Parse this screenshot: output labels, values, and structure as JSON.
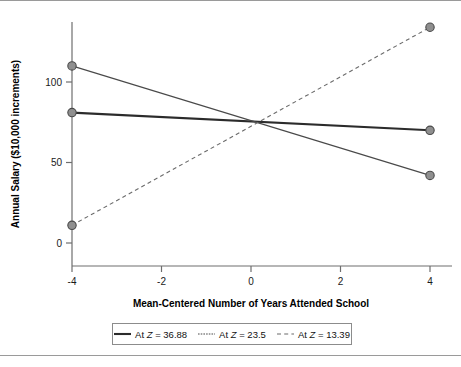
{
  "figure": {
    "has_top_rule": true,
    "has_bottom_rule": true
  },
  "axes": {
    "x": {
      "label": "Mean-Centered Number of Years Attended School",
      "ticks": [
        "-4",
        "-2",
        "0",
        "2",
        "4"
      ],
      "tick_values": [
        -4,
        -2,
        0,
        2,
        4
      ],
      "range": [
        -4.8,
        4.8
      ]
    },
    "y": {
      "label": "Annual Salary ($10,000 increments)",
      "ticks": [
        "0",
        "50",
        "100"
      ],
      "tick_values": [
        0,
        50,
        100
      ],
      "range": [
        -8,
        145
      ]
    }
  },
  "legend": {
    "entries": [
      {
        "label_prefix": "At ",
        "label_var": "Z",
        "label_suffix": " = 36.88",
        "style": "solid-thick"
      },
      {
        "label_prefix": "At ",
        "label_var": "Z",
        "label_suffix": " = 23.5",
        "style": "solid-thin"
      },
      {
        "label_prefix": "At ",
        "label_var": "Z",
        "label_suffix": " = 13.39",
        "style": "dashed"
      }
    ]
  },
  "chart_data": {
    "type": "line",
    "title": "",
    "subtitle": "",
    "xlabel": "Mean-Centered Number of Years Attended School",
    "ylabel": "Annual Salary ($10,000 increments)",
    "x": [
      -4,
      4
    ],
    "xlim": [
      -4.8,
      4.8
    ],
    "ylim": [
      -8,
      145
    ],
    "xticks": [
      -4,
      -2,
      0,
      2,
      4
    ],
    "yticks": [
      0,
      50,
      100
    ],
    "grid": false,
    "legend_position": "bottom-center",
    "markers": "filled-gray-circles-at-endpoints",
    "series": [
      {
        "name": "At Z = 36.88",
        "z_value": 36.88,
        "style": "solid-thick",
        "values": [
          81,
          70
        ],
        "points": [
          {
            "x": -4,
            "y": 81
          },
          {
            "x": 4,
            "y": 70
          }
        ]
      },
      {
        "name": "At Z = 23.5",
        "z_value": 23.5,
        "style": "solid-thin",
        "values": [
          110,
          42
        ],
        "points": [
          {
            "x": -4,
            "y": 110
          },
          {
            "x": 4,
            "y": 42
          }
        ]
      },
      {
        "name": "At Z = 13.39",
        "z_value": 13.39,
        "style": "dashed",
        "values": [
          11,
          134
        ],
        "points": [
          {
            "x": -4,
            "y": 11
          },
          {
            "x": 4,
            "y": 134
          }
        ]
      }
    ],
    "annotations": [
      "All three lines intersect near x = 0, y = 75"
    ]
  },
  "colors": {
    "series_solid_thick": "#2b2b2b",
    "series_solid_thin": "#4a4a4a",
    "series_dashed": "#6b6b6b",
    "marker_fill": "#8f8f8f",
    "marker_stroke": "#4a4a4a",
    "axis": "#6e6e6e",
    "rule": "#9a9a9a",
    "background": "#ffffff"
  }
}
